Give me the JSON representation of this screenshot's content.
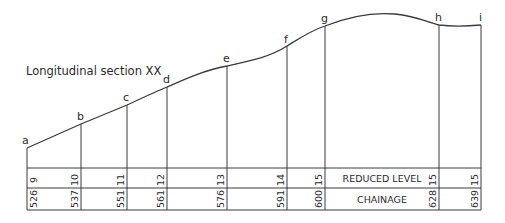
{
  "title": "Longitudinal section XX",
  "rows": {
    "reduced_level_label": "REDUCED LEVEL",
    "chainage_label": "CHAINAGE"
  },
  "points": [
    {
      "label": "a",
      "chainage": "526",
      "reduced_level": "9",
      "x": 27,
      "y": 148
    },
    {
      "label": "b",
      "chainage": "537",
      "reduced_level": "10",
      "x": 81,
      "y": 124
    },
    {
      "label": "c",
      "chainage": "551",
      "reduced_level": "11",
      "x": 127,
      "y": 105
    },
    {
      "label": "d",
      "chainage": "561",
      "reduced_level": "12",
      "x": 167,
      "y": 87
    },
    {
      "label": "e",
      "chainage": "576",
      "reduced_level": "13",
      "x": 227,
      "y": 66
    },
    {
      "label": "f",
      "chainage": "591",
      "reduced_level": "14",
      "x": 287,
      "y": 46
    },
    {
      "label": "g",
      "chainage": "600",
      "reduced_level": "15",
      "x": 325,
      "y": 26
    },
    {
      "label": "h",
      "chainage": "628",
      "reduced_level": "15",
      "x": 439,
      "y": 25
    },
    {
      "label": "i",
      "chainage": "639",
      "reduced_level": "15",
      "x": 481,
      "y": 25
    }
  ],
  "colors": {
    "line": "#3a3a3a",
    "text": "#2a2a2a",
    "background": "#ffffff"
  }
}
